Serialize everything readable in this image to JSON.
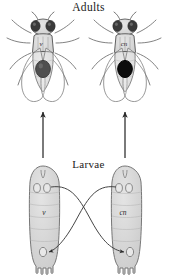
{
  "figure": {
    "kind": "biology-diagram",
    "background_color": "#ffffff"
  },
  "sections": {
    "adults": {
      "title": "Adults",
      "left": {
        "genotype": "v",
        "eye_disc_color": "#4f4f4f",
        "body_fill": "#d8d8d8"
      },
      "right": {
        "genotype": "cn",
        "eye_disc_color": "#0d0d0d",
        "body_fill": "#d8d8d8"
      }
    },
    "larvae": {
      "title": "Larvae",
      "left": {
        "genotype": "v",
        "body_fill": "#d6d6d6"
      },
      "right": {
        "genotype": "cn",
        "body_fill": "#d6d6d6"
      }
    }
  },
  "arrows": {
    "development_left": "larva-to-adult-left",
    "development_right": "larva-to-adult-right",
    "transplant_left_to_right": "v-disc-to-cn-host",
    "transplant_right_to_left": "cn-disc-to-v-host"
  },
  "colors": {
    "outline": "#555555",
    "body_fill": "#d8d8d8",
    "dark_eye": "#0d0d0d",
    "gray_eye": "#4f4f4f",
    "arrow": "#2a2a2a",
    "text": "#1a1a1a"
  }
}
